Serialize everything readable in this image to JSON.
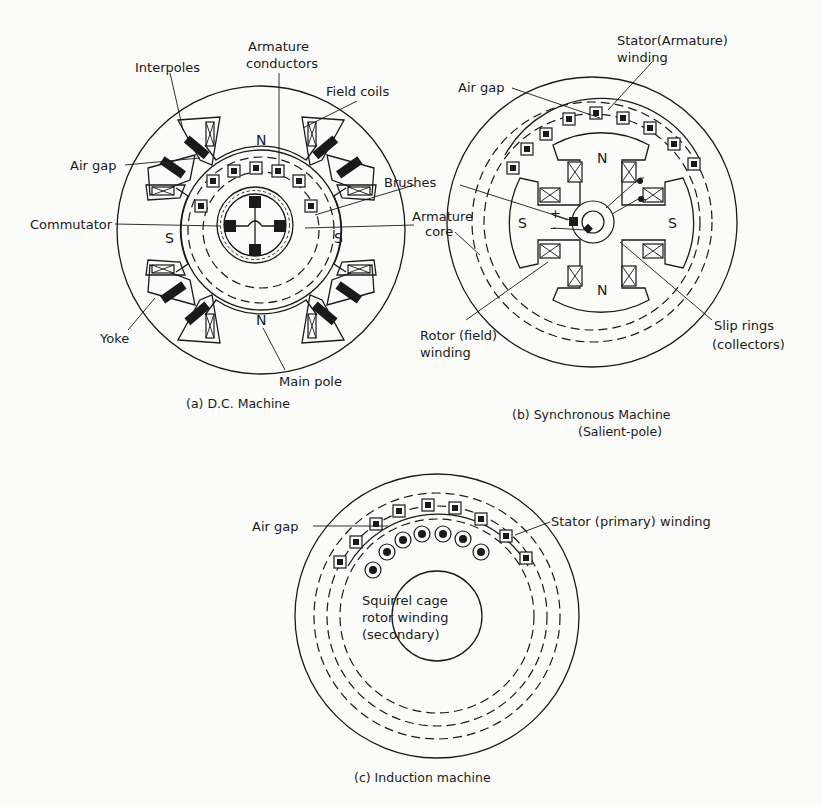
{
  "figure": {
    "panels": [
      {
        "id": "a",
        "caption": "(a) D.C. Machine",
        "labels": {
          "interpoles": "Interpoles",
          "armature_conductors_1": "Armature",
          "armature_conductors_2": "conductors",
          "field_coils": "Field coils",
          "air_gap": "Air gap",
          "brushes": "Brushes",
          "commutator": "Commutator",
          "armature_core_1": "Armature",
          "armature_core_2": "core",
          "yoke": "Yoke",
          "main_pole": "Main pole"
        },
        "poles": {
          "top": "N",
          "bottom": "N",
          "left": "S",
          "right": "S"
        }
      },
      {
        "id": "b",
        "caption_1": "(b)  Synchronous Machine",
        "caption_2": "(Salient-pole)",
        "labels": {
          "stator_winding_1": "Stator(Armature)",
          "stator_winding_2": "winding",
          "air_gap": "Air gap",
          "rotor_winding_1": "Rotor (field)",
          "rotor_winding_2": "winding",
          "slip_rings_1": "Slip rings",
          "slip_rings_2": "(collectors)",
          "plus": "+",
          "minus": "–"
        },
        "poles": {
          "top": "N",
          "bottom": "N",
          "left": "S",
          "right": "S"
        }
      },
      {
        "id": "c",
        "caption": "(c) Induction machine",
        "labels": {
          "air_gap": "Air gap",
          "stator_winding": "Stator (primary) winding",
          "rotor_1": "Squirrel cage",
          "rotor_2": "rotor winding",
          "rotor_3": "(secondary)"
        }
      }
    ]
  }
}
